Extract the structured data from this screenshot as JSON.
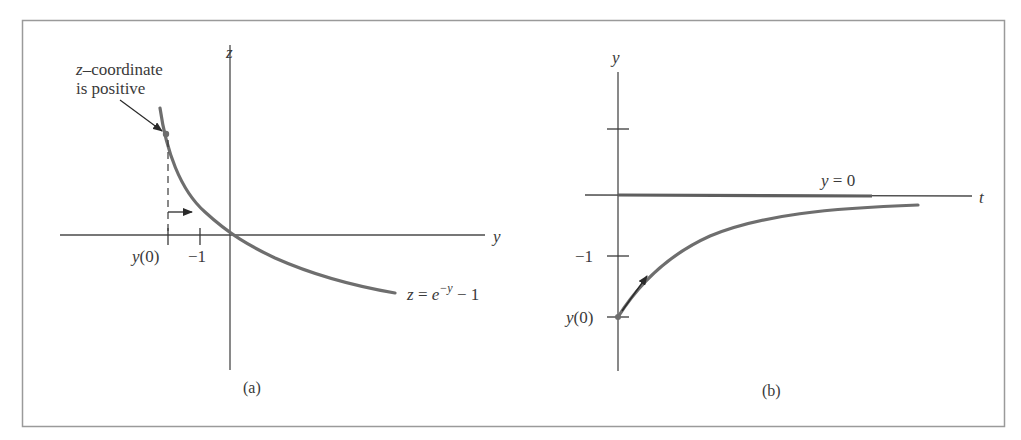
{
  "figure": {
    "panel_a": {
      "caption": "(a)",
      "vertical_axis_label": "z",
      "horizontal_axis_label": "y",
      "curve_label": {
        "lhs": "z",
        "eq": " = ",
        "base": "e",
        "exp": "−y",
        "rest": " − 1"
      },
      "annotation_line1": "–coordinate",
      "annotation_var": "z",
      "annotation_line2": "is positive",
      "tick_labels": {
        "y0_var": "y",
        "y0_rest": "(0)",
        "minus_one": "−1"
      }
    },
    "panel_b": {
      "caption": "(b)",
      "vertical_axis_label": "y",
      "horizontal_axis_label": "t",
      "equilibrium_label": {
        "var": "y",
        "rest": " = 0"
      },
      "tick_labels": {
        "minus_one": "−1",
        "y0_var": "y",
        "y0_rest": "(0)"
      }
    }
  },
  "colors": {
    "axis": "#4a4a4a",
    "curve": "#6e6e6e",
    "border": "#9a9a9a",
    "text": "#3a3a3a"
  }
}
